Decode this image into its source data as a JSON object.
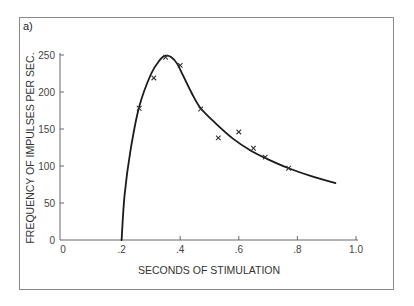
{
  "panel_label": "a)",
  "chart_data": {
    "type": "scatter",
    "title": "",
    "xlabel": "SECONDS OF STIMULATION",
    "ylabel": "FREQUENCY OF IMPULSES PER SEC.",
    "xlim": [
      0,
      1.0
    ],
    "ylim": [
      0,
      250
    ],
    "x_ticks": [
      0,
      0.2,
      0.4,
      0.6,
      0.8,
      1.0
    ],
    "x_tick_labels": [
      "0",
      ".2",
      ".4",
      ".6",
      ".8",
      "1.0"
    ],
    "y_ticks": [
      0,
      50,
      100,
      150,
      200,
      250
    ],
    "y_tick_labels": [
      "0",
      "50",
      "100",
      "150",
      "200",
      "250"
    ],
    "grid": false,
    "legend": null,
    "series": [
      {
        "name": "observed",
        "marker": "x",
        "x": [
          0.26,
          0.31,
          0.35,
          0.4,
          0.47,
          0.53,
          0.6,
          0.65,
          0.69,
          0.77
        ],
        "y": [
          178,
          219,
          247,
          236,
          177,
          138,
          146,
          124,
          112,
          97
        ]
      },
      {
        "name": "fitted curve",
        "style": "line",
        "x": [
          0.2,
          0.21,
          0.23,
          0.26,
          0.3,
          0.33,
          0.35,
          0.37,
          0.39,
          0.41,
          0.44,
          0.47,
          0.52,
          0.58,
          0.64,
          0.7,
          0.77,
          0.85,
          0.93
        ],
        "y": [
          0,
          60,
          120,
          180,
          224,
          243,
          249,
          247,
          238,
          222,
          198,
          178,
          158,
          137,
          121,
          109,
          97,
          86,
          77
        ]
      }
    ]
  }
}
